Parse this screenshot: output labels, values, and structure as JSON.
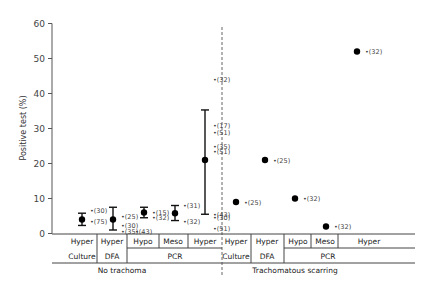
{
  "chart_data": {
    "type": "scatter",
    "title": "",
    "xlabel": "",
    "ylabel": "Positive test (%)",
    "ylim": [
      0,
      60
    ],
    "yticks": [
      0,
      10,
      20,
      30,
      40,
      50,
      60
    ],
    "grid": false,
    "legend": null,
    "groups": [
      {
        "name": "No trachoma",
        "points": [
          {
            "test": "Culture",
            "endemicity": "Hyper",
            "mean": 4,
            "low": 2.3,
            "high": 5.8,
            "studies": [
              {
                "ref": "(30)",
                "value": 6.5
              },
              {
                "ref": "(75)",
                "value": 3.5
              }
            ]
          },
          {
            "test": "DFA",
            "endemicity": "Hyper",
            "mean": 4,
            "low": 1,
            "high": 7.5,
            "studies": [
              {
                "ref": "(25)",
                "value": 5
              },
              {
                "ref": "(30)",
                "value": 2.3
              },
              {
                "ref": "(35)",
                "value": 0.5
              },
              {
                "ref": "(43)",
                "value": 0.5
              }
            ]
          },
          {
            "test": "PCR",
            "endemicity": "Hypo",
            "mean": 6,
            "low": 4.5,
            "high": 7.5,
            "studies": [
              {
                "ref": "(15)",
                "value": 6
              },
              {
                "ref": "(32)",
                "value": 4.5
              }
            ]
          },
          {
            "test": "PCR",
            "endemicity": "Meso",
            "mean": 5.8,
            "low": 3.7,
            "high": 8,
            "studies": [
              {
                "ref": "(31)",
                "value": 8
              },
              {
                "ref": "(32)",
                "value": 3.5
              }
            ]
          },
          {
            "test": "PCR",
            "endemicity": "Hyper",
            "mean": 21,
            "low": 5.5,
            "high": 35.3,
            "studies": [
              {
                "ref": "(32)",
                "value": 44
              },
              {
                "ref": "(17)",
                "value": 31
              },
              {
                "ref": "(51)",
                "value": 29
              },
              {
                "ref": "(35)",
                "value": 25
              },
              {
                "ref": "(51)",
                "value": 23.5
              },
              {
                "ref": "(43)",
                "value": 5.5
              },
              {
                "ref": "(30)",
                "value": 4.5
              },
              {
                "ref": "(51)",
                "value": 1.5
              }
            ]
          }
        ]
      },
      {
        "name": "Trachomatous scarring",
        "points": [
          {
            "test": "Culture",
            "endemicity": "Hyper",
            "mean": 9,
            "studies": [
              {
                "ref": "(25)",
                "value": 9
              }
            ]
          },
          {
            "test": "DFA",
            "endemicity": "Hyper",
            "mean": 21,
            "studies": [
              {
                "ref": "(25)",
                "value": 21
              }
            ]
          },
          {
            "test": "PCR",
            "endemicity": "Hypo",
            "mean": 10,
            "studies": [
              {
                "ref": "(32)",
                "value": 10
              }
            ]
          },
          {
            "test": "PCR",
            "endemicity": "Meso",
            "mean": 2,
            "studies": [
              {
                "ref": "(32)",
                "value": 2
              }
            ]
          },
          {
            "test": "PCR",
            "endemicity": "Hyper",
            "mean": 52,
            "studies": [
              {
                "ref": "(32)",
                "value": 52
              }
            ]
          }
        ]
      }
    ],
    "x_axis_rows": {
      "endemicity": [
        "Hyper",
        "Hyper",
        "Hypo",
        "Meso",
        "Hyper",
        "Hyper",
        "Hyper",
        "Hypo",
        "Meso",
        "Hyper"
      ],
      "test": [
        "Culture",
        "DFA",
        "PCR",
        "Culture",
        "DFA",
        "PCR"
      ],
      "group": [
        "No trachoma",
        "Trachomatous scarring"
      ]
    }
  }
}
